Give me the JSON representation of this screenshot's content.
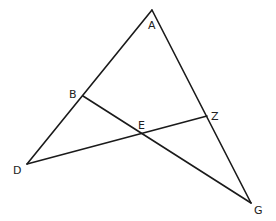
{
  "diagram": {
    "type": "geometry",
    "points": {
      "A": {
        "label": "A",
        "x": 152,
        "y": 10
      },
      "B": {
        "label": "B",
        "x": 83,
        "y": 96
      },
      "D": {
        "label": "D",
        "x": 27,
        "y": 164
      },
      "E": {
        "label": "E",
        "x": 143,
        "y": 133
      },
      "Z": {
        "label": "Z",
        "x": 207,
        "y": 116
      },
      "G": {
        "label": "G",
        "x": 251,
        "y": 203
      }
    },
    "segments": [
      {
        "name": "AD",
        "from": "A",
        "to": "D"
      },
      {
        "name": "AG",
        "from": "A",
        "to": "G"
      },
      {
        "name": "BG",
        "from": "B",
        "to": "G"
      },
      {
        "name": "DZ",
        "from": "D",
        "to": "Z"
      }
    ],
    "labels": {
      "A": "A",
      "B": "B",
      "D": "D",
      "E": "E",
      "Z": "Z",
      "G": "G"
    },
    "colors": {
      "line": "#1a1a1a",
      "text": "#222222",
      "background": "#ffffff"
    }
  }
}
